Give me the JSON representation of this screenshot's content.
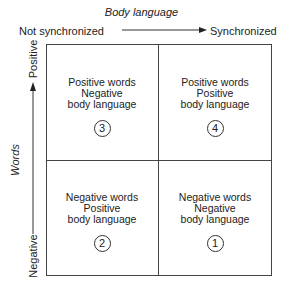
{
  "x_axis": {
    "title": "Body language",
    "left_label": "Not synchronized",
    "right_label": "Synchronized"
  },
  "y_axis": {
    "title": "Words",
    "top_label": "Positive",
    "bottom_label": "Negative"
  },
  "quadrants": {
    "top_left": {
      "line1": "Positive words",
      "line2": "Negative",
      "line3": "body language",
      "number": "3"
    },
    "top_right": {
      "line1": "Positive words",
      "line2": "Positive",
      "line3": "body language",
      "number": "4"
    },
    "bottom_left": {
      "line1": "Negative words",
      "line2": "Positive",
      "line3": "body language",
      "number": "2"
    },
    "bottom_right": {
      "line1": "Negative words",
      "line2": "Negative",
      "line3": "body language",
      "number": "1"
    }
  },
  "colors": {
    "line": "#444444",
    "text": "#222222",
    "background": "#ffffff"
  }
}
